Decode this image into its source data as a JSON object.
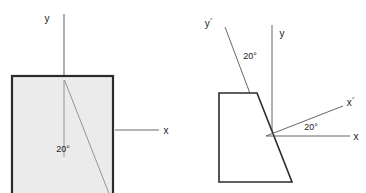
{
  "figure": {
    "background_color": "#ffffff",
    "stroke_color": "#333333",
    "thin_stroke_color": "#6b6b6b",
    "square_fill": "#ebebeb",
    "square_stroke": "#2b2b2b"
  },
  "left_figure": {
    "name": "undeformed-square-with-axes",
    "shape_type": "square",
    "fill": "#ebebeb",
    "axis_y_label": "y",
    "axis_x_label": "x",
    "angle_label": "20°",
    "angle_value": 20,
    "square": {
      "x": 12,
      "y": 76,
      "width": 101,
      "height": 120
    },
    "y_axis_line": {
      "x1": 64,
      "y1": 14,
      "x2": 64,
      "y2": 78
    },
    "x_axis_line": {
      "x1": 114,
      "y1": 130,
      "x2": 160,
      "y2": 130
    },
    "reference_line": {
      "x1": 64,
      "y1": 82,
      "x2": 64,
      "y2": 156
    },
    "slant_line": {
      "x1": 65,
      "y1": 82,
      "x2": 110,
      "y2": 193
    },
    "y_label_pos": {
      "x": 47,
      "y": 22
    },
    "x_label_pos": {
      "x": 166,
      "y": 134
    },
    "angle_label_pos": {
      "x": 63,
      "y": 150
    }
  },
  "right_figure": {
    "name": "deformed-trapezoid-with-rotated-axes",
    "shape_type": "trapezoid",
    "fill": "#ffffff",
    "axis_y_label": "y",
    "axis_y_prime_label": "y´",
    "axis_x_label": "x",
    "axis_x_prime_label": "x´",
    "angle_label_top": "20°",
    "angle_label_right": "20°",
    "angle_value": 20,
    "origin": {
      "x": 266,
      "y": 136
    },
    "polygon_points": "219,93 257,93 292,182 219,182",
    "y_axis_line": {
      "x1": 272,
      "y1": 25,
      "x2": 272,
      "y2": 136
    },
    "y_prime_line": {
      "x1": 225,
      "y1": 26,
      "x2": 266,
      "y2": 136
    },
    "x_axis_line": {
      "x1": 266,
      "y1": 136,
      "x2": 352,
      "y2": 136
    },
    "x_prime_line": {
      "x1": 266,
      "y1": 136,
      "x2": 345,
      "y2": 105
    },
    "y_label_pos": {
      "x": 281,
      "y": 37
    },
    "y_prime_label_pos": {
      "x": 209,
      "y": 27
    },
    "x_label_pos": {
      "x": 355,
      "y": 140
    },
    "x_prime_label_pos": {
      "x": 348,
      "y": 106
    },
    "angle_top_label_pos": {
      "x": 244,
      "y": 59
    },
    "angle_right_label_pos": {
      "x": 307,
      "y": 130
    }
  }
}
